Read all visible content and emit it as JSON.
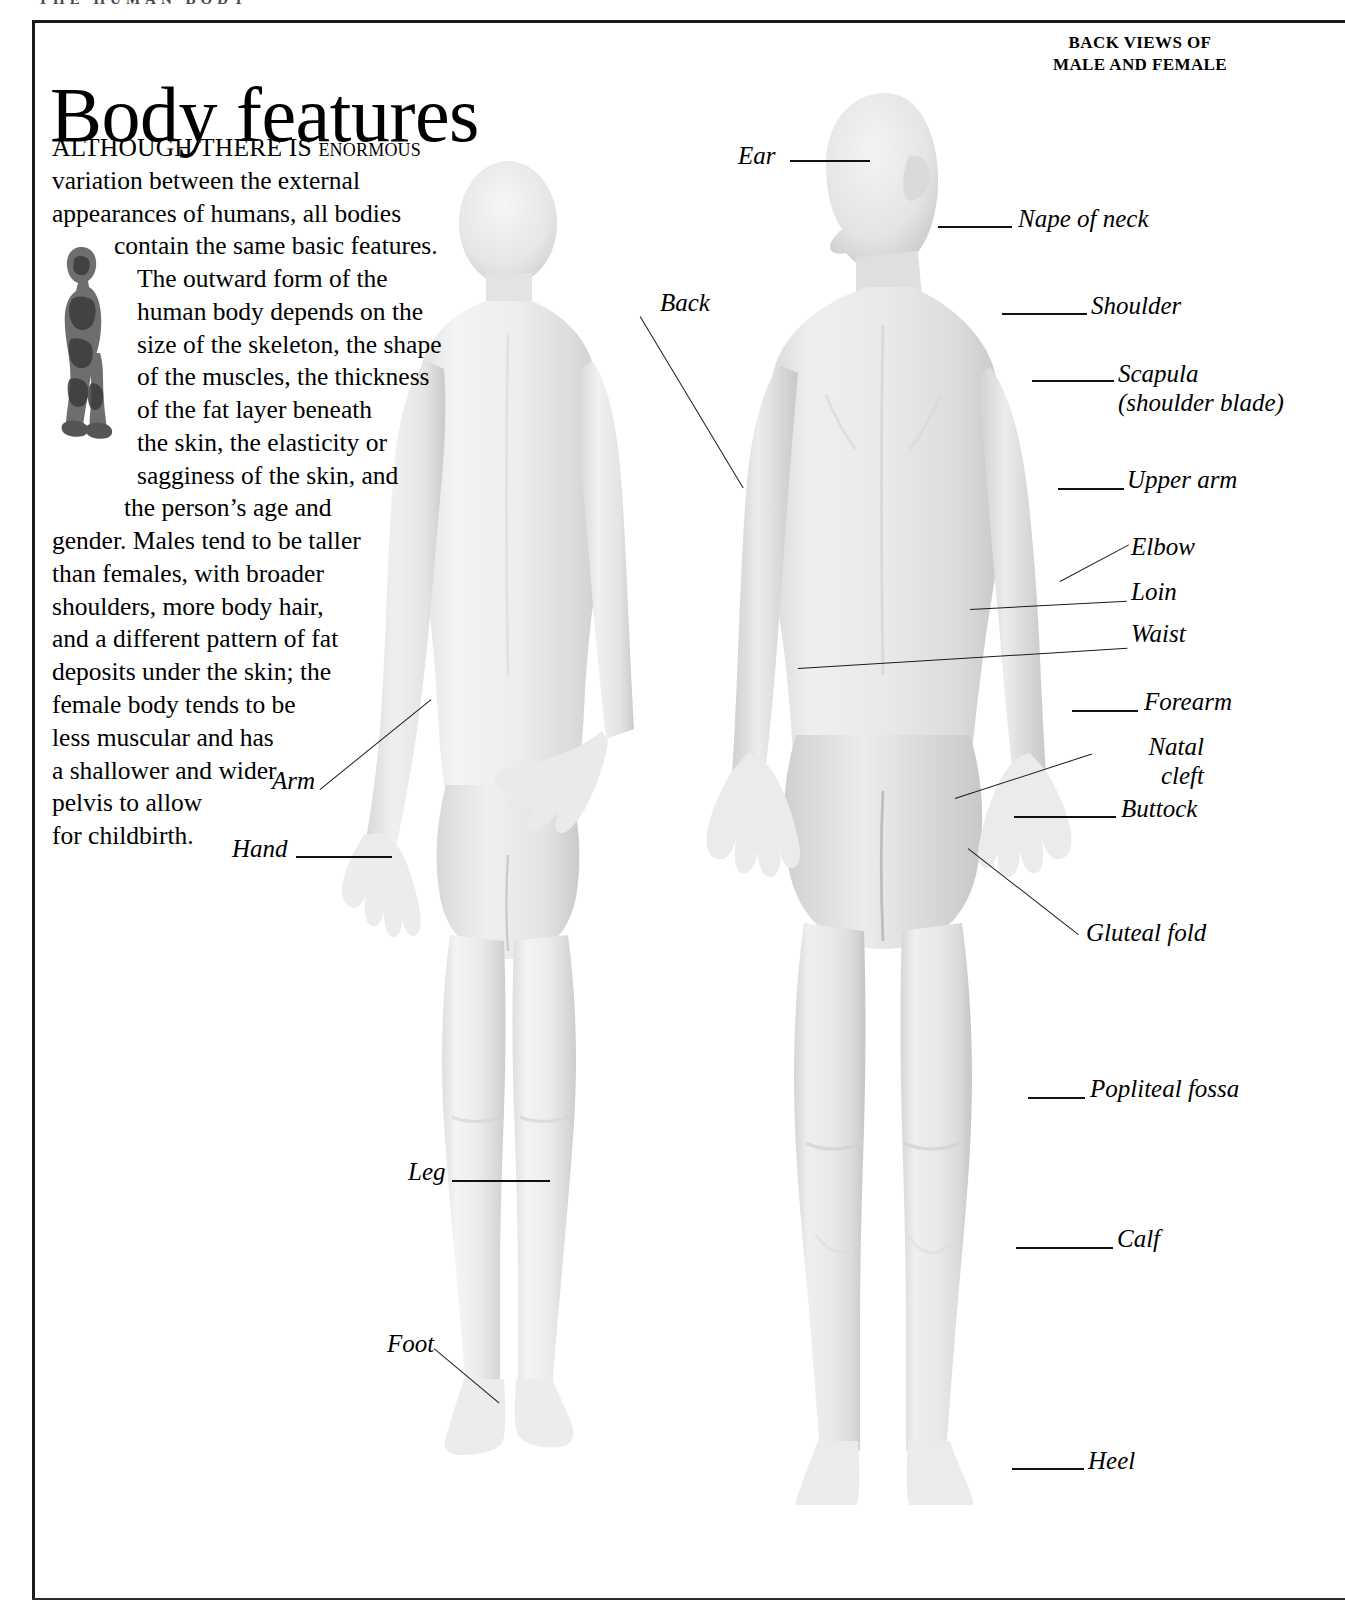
{
  "page": {
    "running_head": "THE HUMAN BODY",
    "title": "Body features",
    "corner_heading_line1": "BACK VIEWS OF",
    "corner_heading_line2": "MALE AND FEMALE"
  },
  "intro": {
    "lines": [
      "ALTHOUGH THERE IS enormous",
      "variation between the external",
      "appearances of humans, all bodies",
      "contain the same basic features.",
      "The outward form of the",
      "human body depends on the",
      "size of the skeleton, the shape",
      "of the muscles, the thickness",
      "of the fat layer beneath",
      "the skin, the elasticity or",
      "sagginess of the skin, and",
      "the person’s age and",
      "gender. Males tend to be taller",
      "than females, with broader",
      "shoulders, more body hair,",
      "and a different pattern of fat",
      "deposits under the skin; the",
      "female body tends to be",
      "less muscular and has",
      "a shallower and wider",
      "pelvis to allow",
      "for childbirth."
    ],
    "dropcap_words": "ALTHOUGH THERE IS"
  },
  "figures": [
    {
      "name": "female-back-view",
      "caption": "Female body, back view"
    },
    {
      "name": "male-back-view",
      "caption": "Male body, back view"
    },
    {
      "name": "inset-anatomy-figure",
      "caption": "Small anatomical side view figure"
    }
  ],
  "labels_left": [
    {
      "text": "Ear",
      "id": "ear"
    },
    {
      "text": "Back",
      "id": "back"
    },
    {
      "text": "Arm",
      "id": "arm"
    },
    {
      "text": "Hand",
      "id": "hand"
    },
    {
      "text": "Leg",
      "id": "leg"
    },
    {
      "text": "Foot",
      "id": "foot"
    }
  ],
  "labels_right": [
    {
      "text": "Nape of neck",
      "id": "nape-of-neck"
    },
    {
      "text": "Shoulder",
      "id": "shoulder"
    },
    {
      "text": "Scapula",
      "text2": "(shoulder blade)",
      "id": "scapula"
    },
    {
      "text": "Upper arm",
      "id": "upper-arm"
    },
    {
      "text": "Elbow",
      "id": "elbow"
    },
    {
      "text": "Loin",
      "id": "loin"
    },
    {
      "text": "Waist",
      "id": "waist"
    },
    {
      "text": "Forearm",
      "id": "forearm"
    },
    {
      "text": "Natal",
      "text2": "cleft",
      "id": "natal-cleft"
    },
    {
      "text": "Buttock",
      "id": "buttock"
    },
    {
      "text": "Gluteal fold",
      "id": "gluteal-fold"
    },
    {
      "text": "Popliteal fossa",
      "id": "popliteal-fossa"
    },
    {
      "text": "Calf",
      "id": "calf"
    },
    {
      "text": "Heel",
      "id": "heel"
    }
  ],
  "colors": {
    "ink": "#000000",
    "rule": "#1a1a1a",
    "skin_light": "#f2f2f2",
    "skin_mid": "#e2e2e2",
    "skin_shade": "#cfcfcf"
  }
}
